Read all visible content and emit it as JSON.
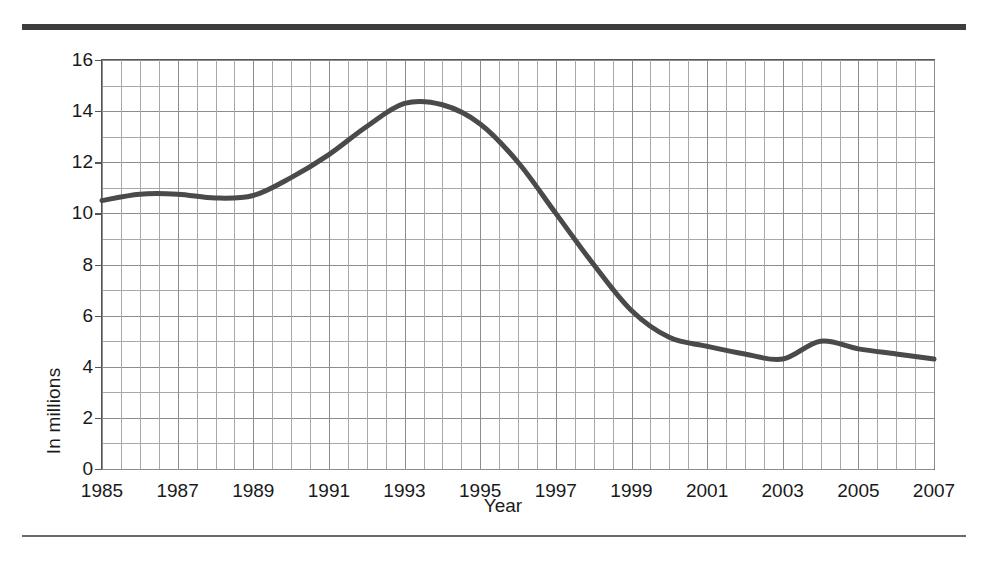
{
  "figure": {
    "rule_color": "#3d3d3d",
    "line_color": "#4a4a4a",
    "grid_color": "#8d8d8d"
  },
  "chart_data": {
    "type": "line",
    "title": "",
    "xlabel": "Year",
    "ylabel": "In millions",
    "xlim": [
      1985,
      2007
    ],
    "ylim": [
      0,
      16
    ],
    "ytick_step": 2,
    "y_minor_step": 1,
    "x_minor_step": 0.5,
    "grid": "on",
    "legend": "none",
    "ytick_labels": [
      "0",
      "2",
      "4",
      "6",
      "8",
      "10",
      "12",
      "14",
      "16"
    ],
    "ytick_values": [
      0,
      2,
      4,
      6,
      8,
      10,
      12,
      14,
      16
    ],
    "xtick_labels": [
      "1985",
      "1987",
      "1989",
      "1991",
      "1993",
      "1995",
      "1997",
      "1999",
      "2001",
      "2003",
      "2005",
      "2007"
    ],
    "xtick_values": [
      1985,
      1987,
      1989,
      1991,
      1993,
      1995,
      1997,
      1999,
      2001,
      2003,
      2005,
      2007
    ],
    "x": [
      1985,
      1986,
      1987,
      1988,
      1989,
      1990,
      1991,
      1992,
      1993,
      1994,
      1995,
      1996,
      1997,
      1998,
      1999,
      2000,
      2001,
      2002,
      2003,
      2004,
      2005,
      2006,
      2007
    ],
    "values": [
      10.5,
      10.75,
      10.75,
      10.6,
      10.7,
      11.4,
      12.3,
      13.4,
      14.3,
      14.25,
      13.5,
      12.0,
      10.0,
      8.0,
      6.2,
      5.15,
      4.8,
      4.5,
      4.3,
      5.0,
      4.7,
      4.5,
      4.3
    ],
    "series": [
      {
        "name": "In millions",
        "values": [
          10.5,
          10.75,
          10.75,
          10.6,
          10.7,
          11.4,
          12.3,
          13.4,
          14.3,
          14.25,
          13.5,
          12.0,
          10.0,
          8.0,
          6.2,
          5.15,
          4.8,
          4.5,
          4.3,
          5.0,
          4.7,
          4.5,
          4.3
        ]
      }
    ]
  }
}
